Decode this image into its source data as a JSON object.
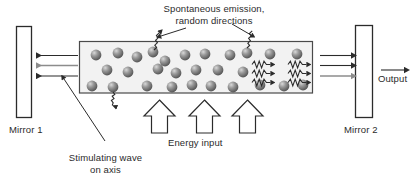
{
  "figure": {
    "title_caption": "",
    "colors": {
      "line": "#2b2b2b",
      "gray_arrow": "#8c8c8c",
      "atom_dark": "#5a5a5a",
      "atom_light": "#b8b8b8",
      "cavity_fill": "#f2f2f2",
      "mirror_fill": "#ffffff",
      "background": "#ffffff"
    }
  },
  "labels": {
    "spontaneous_line1": "Spontaneous emission,",
    "spontaneous_line2": "random directions",
    "mirror1": "Mirror 1",
    "mirror2": "Mirror 2",
    "output": "Output",
    "energy_input": "Energy input",
    "stimulating_line1": "Stimulating wave",
    "stimulating_line2": "on axis"
  },
  "components": {
    "mirror1": {
      "name": "Mirror 1",
      "x": 16,
      "y": 26,
      "width": 15,
      "height": 91
    },
    "mirror2": {
      "name": "Mirror 2",
      "x": 355,
      "y": 25,
      "width": 17,
      "height": 92
    },
    "cavity": {
      "name": "Gain medium cavity",
      "x": 79,
      "y": 41,
      "width": 234,
      "height": 52
    },
    "atom_count": 28,
    "left_arrows": 3,
    "right_arrows": 3,
    "energy_arrows": 3,
    "wave_packets_inside": 3,
    "wave_packets_outside": 3
  },
  "atoms": [
    {
      "cx": 96,
      "cy": 55
    },
    {
      "cx": 118,
      "cy": 53
    },
    {
      "cx": 137,
      "cy": 57
    },
    {
      "cx": 153,
      "cy": 52
    },
    {
      "cx": 185,
      "cy": 55
    },
    {
      "cx": 205,
      "cy": 54
    },
    {
      "cx": 230,
      "cy": 55
    },
    {
      "cx": 247,
      "cy": 53
    },
    {
      "cx": 270,
      "cy": 54
    },
    {
      "cx": 297,
      "cy": 54
    },
    {
      "cx": 107,
      "cy": 70
    },
    {
      "cx": 128,
      "cy": 72
    },
    {
      "cx": 158,
      "cy": 69
    },
    {
      "cx": 176,
      "cy": 73
    },
    {
      "cx": 196,
      "cy": 70
    },
    {
      "cx": 218,
      "cy": 70
    },
    {
      "cx": 243,
      "cy": 72
    },
    {
      "cx": 92,
      "cy": 86
    },
    {
      "cx": 113,
      "cy": 87
    },
    {
      "cx": 147,
      "cy": 86
    },
    {
      "cx": 172,
      "cy": 87
    },
    {
      "cx": 192,
      "cy": 85
    },
    {
      "cx": 211,
      "cy": 86
    },
    {
      "cx": 233,
      "cy": 87
    },
    {
      "cx": 260,
      "cy": 85
    },
    {
      "cx": 284,
      "cy": 86
    },
    {
      "cx": 303,
      "cy": 85
    },
    {
      "cx": 165,
      "cy": 61
    }
  ]
}
